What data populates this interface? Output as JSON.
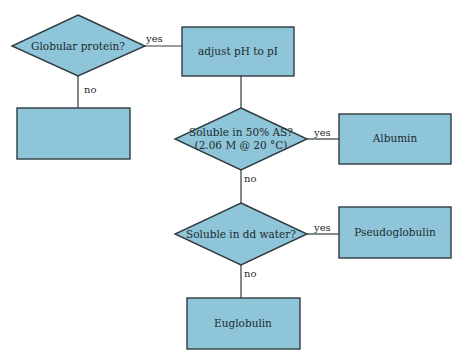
{
  "diagram": {
    "type": "flowchart",
    "colors": {
      "fill": "#8ec5d9",
      "stroke": "#2f3b40",
      "text": "#222a2e"
    },
    "nodes": {
      "globular": {
        "shape": "diamond",
        "text": "Globular protein?"
      },
      "adjust": {
        "shape": "rect",
        "text": "adjust pH to pI"
      },
      "empty": {
        "shape": "rect",
        "text": ""
      },
      "soluble_as_line1": {
        "shape": "diamond",
        "text": "Soluble in 50% AS?"
      },
      "soluble_as_line2": {
        "text": "(2.06 M @ 20 °C)"
      },
      "albumin": {
        "shape": "rect",
        "text": "Albumin"
      },
      "soluble_water": {
        "shape": "diamond",
        "text": "Soluble in dd water?"
      },
      "pseudoglobulin": {
        "shape": "rect",
        "text": "Pseudoglobulin"
      },
      "euglobulin": {
        "shape": "rect",
        "text": "Euglobulin"
      }
    },
    "edges": {
      "globular_yes": "yes",
      "globular_no": "no",
      "as_yes": "yes",
      "as_no": "no",
      "water_yes": "yes",
      "water_no": "no"
    }
  }
}
